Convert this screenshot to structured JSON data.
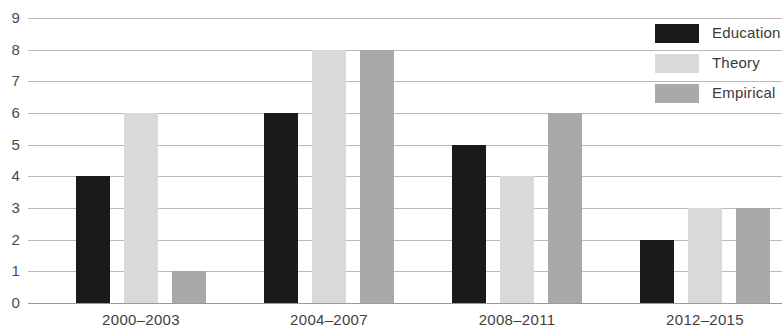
{
  "chart_data": {
    "type": "bar",
    "title": "",
    "subtitle": "",
    "xlabel": "",
    "ylabel": "",
    "categories": [
      "2000–2003",
      "2004–2007",
      "2008–2011",
      "2012–2015"
    ],
    "series": [
      {
        "name": "Education",
        "color": "#1a1a1a",
        "values": [
          4,
          6,
          5,
          2
        ]
      },
      {
        "name": "Theory",
        "color": "#d9d9d9",
        "values": [
          6,
          8,
          4,
          3
        ]
      },
      {
        "name": "Empirical",
        "color": "#a9a9a9",
        "values": [
          1,
          8,
          6,
          3
        ]
      }
    ],
    "ylim": [
      0,
      9
    ],
    "yticks": [
      0,
      1,
      2,
      3,
      4,
      5,
      6,
      7,
      8,
      9
    ],
    "ytick_labels": [
      "0",
      "1",
      "2",
      "3",
      "4",
      "5",
      "6",
      "7",
      "8",
      "9"
    ],
    "grid": true,
    "grid_axis": "y",
    "legend": true,
    "legend_position": "top-right",
    "legend_entries": [
      "Education",
      "Theory",
      "Empirical"
    ],
    "bar_grouping": "grouped",
    "background_color": "#ffffff",
    "gridline_color": "#b9b9b9",
    "axis_color": "#9a9a9a"
  }
}
